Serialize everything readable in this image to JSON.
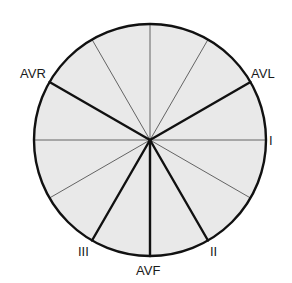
{
  "diagram": {
    "center": [
      150,
      140
    ],
    "radius": 117,
    "fill_color": "#e9e9e9",
    "line_color": "#111111",
    "leads": [
      {
        "label": "I",
        "angle": 0,
        "bold": false
      },
      {
        "label": "AVL",
        "angle": -30,
        "bold": true
      },
      {
        "label": "AVR",
        "angle": -150,
        "bold": true
      },
      {
        "label": "II",
        "angle": 60,
        "bold": true
      },
      {
        "label": "III",
        "angle": 120,
        "bold": true
      },
      {
        "label": "AVF",
        "angle": 90,
        "bold": true
      }
    ],
    "thin_lines_deg": [
      0,
      180,
      -90,
      -60,
      -120,
      30,
      150
    ],
    "labels": {
      "avr": "AVR",
      "avl": "AVL",
      "i": "I",
      "ii": "II",
      "iii": "III",
      "avf": "AVF"
    }
  }
}
